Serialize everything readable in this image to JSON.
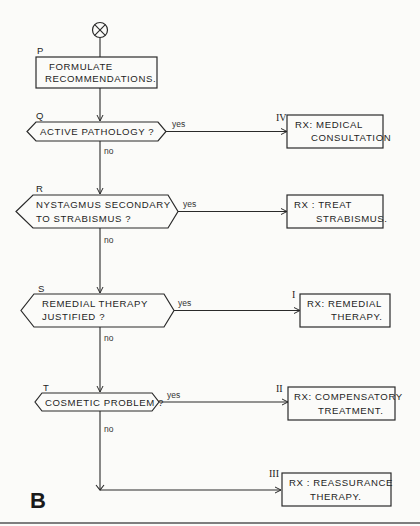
{
  "figure_label": "B",
  "start_symbol": "start-connector",
  "process": {
    "id": "P",
    "lines": [
      "FORMULATE",
      "RECOMMENDATIONS."
    ]
  },
  "decisions": [
    {
      "id": "Q",
      "lines": [
        "ACTIVE  PATHOLOGY ?"
      ],
      "yes": "yes",
      "no": "no"
    },
    {
      "id": "R",
      "lines": [
        "NYSTAGMUS  SECONDARY",
        "TO  STRABISMUS ?"
      ],
      "yes": "yes",
      "no": "no"
    },
    {
      "id": "S",
      "lines": [
        "REMEDIAL  THERAPY",
        "JUSTIFIED ?"
      ],
      "yes": "yes",
      "no": "no"
    },
    {
      "id": "T",
      "lines": [
        "COSMETIC  PROBLEM ?"
      ],
      "yes": "yes",
      "no": "no"
    }
  ],
  "outcomes": [
    {
      "roman": "IV",
      "lines": [
        "RX:  MEDICAL",
        "CONSULTATION"
      ]
    },
    {
      "roman": "",
      "lines": [
        "RX :  TREAT",
        "STRABISMUS."
      ]
    },
    {
      "roman": "I",
      "lines": [
        "RX:  REMEDIAL",
        "THERAPY."
      ]
    },
    {
      "roman": "II",
      "lines": [
        "RX:  COMPENSATORY",
        "TREATMENT."
      ]
    },
    {
      "roman": "III",
      "lines": [
        "RX : REASSURANCE",
        "THERAPY."
      ]
    }
  ]
}
